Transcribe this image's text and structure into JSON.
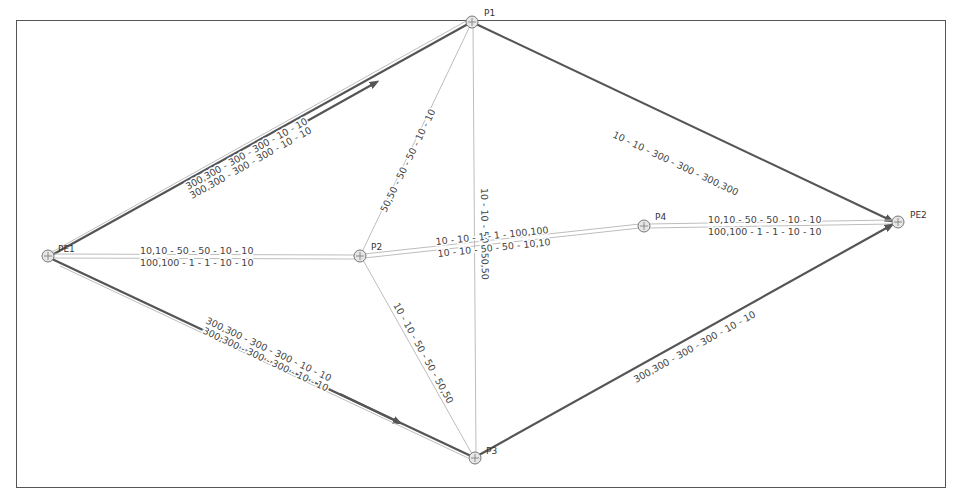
{
  "diagram": {
    "nodes": [
      {
        "id": "PE1",
        "label": "PE1",
        "x": 48,
        "y": 256
      },
      {
        "id": "P1",
        "label": "P1",
        "x": 472,
        "y": 22
      },
      {
        "id": "P2",
        "label": "P2",
        "x": 360,
        "y": 256
      },
      {
        "id": "P3",
        "label": "P3",
        "x": 475,
        "y": 458
      },
      {
        "id": "P4",
        "label": "P4",
        "x": 644,
        "y": 226
      },
      {
        "id": "PE2",
        "label": "PE2",
        "x": 898,
        "y": 222
      }
    ],
    "edges": [
      {
        "from": "PE1",
        "to": "P1",
        "style": "thin",
        "label": "300,300 - 300 - 300 - 10 - 10"
      },
      {
        "from": "PE1",
        "to": "P1",
        "style": "thick",
        "label": "300,300 - 300 - 300 - 10 - 10"
      },
      {
        "from": "P1",
        "to": "PE2",
        "style": "thick",
        "label": "10 - 10 - 300 - 300 - 300,300"
      },
      {
        "from": "P2",
        "to": "P1",
        "style": "thin",
        "label": "50,50 - 50 - 50 - 10 - 10"
      },
      {
        "from": "P1",
        "to": "P3",
        "style": "thin",
        "label": "10 - 10 - 50 - 50,50"
      },
      {
        "from": "PE1",
        "to": "P2",
        "style": "thin",
        "label": "10,10 - 50 - 50 - 10 - 10"
      },
      {
        "from": "PE1",
        "to": "P2",
        "style": "thin",
        "label": "100,100 - 1 - 1 - 10 - 10"
      },
      {
        "from": "P2",
        "to": "P4",
        "style": "thin",
        "label": "10 - 10 - 1 - 1 - 100,100"
      },
      {
        "from": "P2",
        "to": "P4",
        "style": "thin",
        "label": "10 - 10 - 50 - 50 - 10,10"
      },
      {
        "from": "P4",
        "to": "PE2",
        "style": "thin",
        "label": "10,10 - 50 - 50 - 10 - 10"
      },
      {
        "from": "P4",
        "to": "PE2",
        "style": "thin",
        "label": "100,100 - 1 - 1 - 10 - 10"
      },
      {
        "from": "P2",
        "to": "P3",
        "style": "thin",
        "label": "10 - 10 - 50 - 50 - 50,50"
      },
      {
        "from": "PE1",
        "to": "P3",
        "style": "thick",
        "label": "300,300 - 300 - 300 - 10 - 10"
      },
      {
        "from": "PE1",
        "to": "P3",
        "style": "thin",
        "label": "300,300 - 300 - 300 - 10 - 10"
      },
      {
        "from": "P3",
        "to": "PE2",
        "style": "thick",
        "label": "300,300 - 300 - 300 - 10 - 10"
      }
    ]
  }
}
